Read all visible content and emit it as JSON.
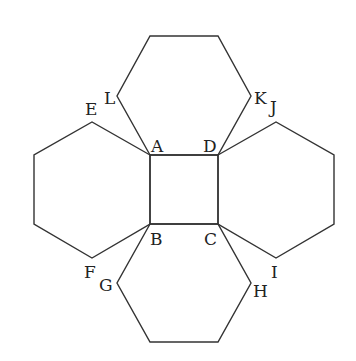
{
  "diagram": {
    "title": "",
    "stroke_color": "#333333",
    "background": "#ffffff",
    "shapes": [
      {
        "name": "square-abcd",
        "type": "square",
        "points": [
          [
            150,
            155
          ],
          [
            218,
            155
          ],
          [
            218,
            224
          ],
          [
            150,
            224
          ]
        ]
      },
      {
        "name": "hexagon-top",
        "type": "hexagon",
        "points": [
          [
            150,
            155
          ],
          [
            117,
            96
          ],
          [
            150,
            36
          ],
          [
            218,
            36
          ],
          [
            251,
            96
          ],
          [
            218,
            155
          ]
        ]
      },
      {
        "name": "hexagon-left",
        "type": "hexagon",
        "points": [
          [
            150,
            155
          ],
          [
            92,
            122
          ],
          [
            34,
            155
          ],
          [
            34,
            224
          ],
          [
            92,
            258
          ],
          [
            150,
            224
          ]
        ]
      },
      {
        "name": "hexagon-right",
        "type": "hexagon",
        "points": [
          [
            218,
            155
          ],
          [
            276,
            122
          ],
          [
            334,
            155
          ],
          [
            334,
            224
          ],
          [
            276,
            258
          ],
          [
            218,
            224
          ]
        ]
      },
      {
        "name": "hexagon-bottom",
        "type": "hexagon",
        "points": [
          [
            150,
            224
          ],
          [
            117,
            283
          ],
          [
            150,
            342
          ],
          [
            218,
            342
          ],
          [
            251,
            283
          ],
          [
            218,
            224
          ]
        ]
      }
    ],
    "labels": [
      {
        "text": "A",
        "x": 151,
        "y": 152
      },
      {
        "text": "D",
        "x": 203,
        "y": 152
      },
      {
        "text": "B",
        "x": 150,
        "y": 245
      },
      {
        "text": "C",
        "x": 204,
        "y": 245
      },
      {
        "text": "E",
        "x": 85,
        "y": 115
      },
      {
        "text": "L",
        "x": 104,
        "y": 104
      },
      {
        "text": "K",
        "x": 254,
        "y": 104
      },
      {
        "text": "J",
        "x": 270,
        "y": 113
      },
      {
        "text": "F",
        "x": 84,
        "y": 278
      },
      {
        "text": "G",
        "x": 99,
        "y": 291
      },
      {
        "text": "H",
        "x": 253,
        "y": 297
      },
      {
        "text": "I",
        "x": 271,
        "y": 278
      }
    ]
  }
}
